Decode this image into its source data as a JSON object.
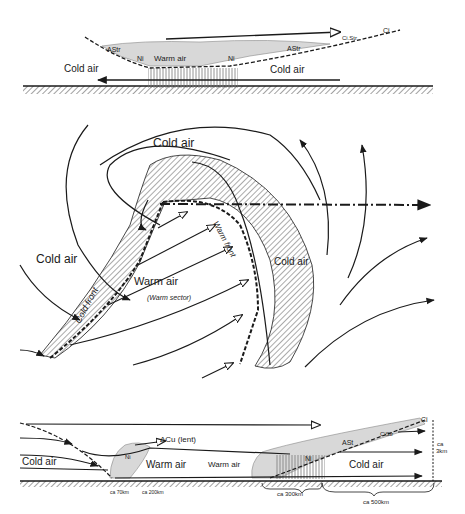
{
  "top_section": {
    "title": "Vertical cross-section through warm front",
    "labels": {
      "cold_air_left": "Cold air",
      "cold_air_right": "Cold air",
      "warm_air": "Warm air",
      "astr_left": "AStr",
      "astr_right": "AStr",
      "ni_left": "Ni",
      "ni_right": "Ni",
      "cistr": "Ci.Str",
      "ci": "Ci"
    }
  },
  "middle_section": {
    "title": "Plan view of frontal depression",
    "labels": {
      "cold_air_top": "Cold air",
      "cold_air_left": "Cold air",
      "cold_air_right": "Cold air",
      "warm_air": "Warm air",
      "warm_sector": "(Warm sector)",
      "cold_front": "Cold front",
      "warm_front": "Warm front"
    }
  },
  "bottom_section": {
    "title": "Vertical cross-section through cold and warm fronts",
    "labels": {
      "cold_air_left": "Cold air",
      "warm_air_1": "Warm air",
      "warm_air_2": "Warm air",
      "cold_air_right": "Cold air",
      "acu": "ΔCu (lent)",
      "ni_left": "Ni",
      "ni_right": "Ni",
      "astr": "ASt",
      "cistr": "CiStr",
      "ci": "Ci",
      "height": "ca",
      "height2": "3km",
      "dist_70": "ca 70km",
      "dist_200": "ca 200km",
      "dist_300": "ca 300km",
      "dist_500": "ca 500km"
    }
  },
  "colors": {
    "ink": "#1a1a1a",
    "hatch": "#555555",
    "background": "#ffffff"
  }
}
